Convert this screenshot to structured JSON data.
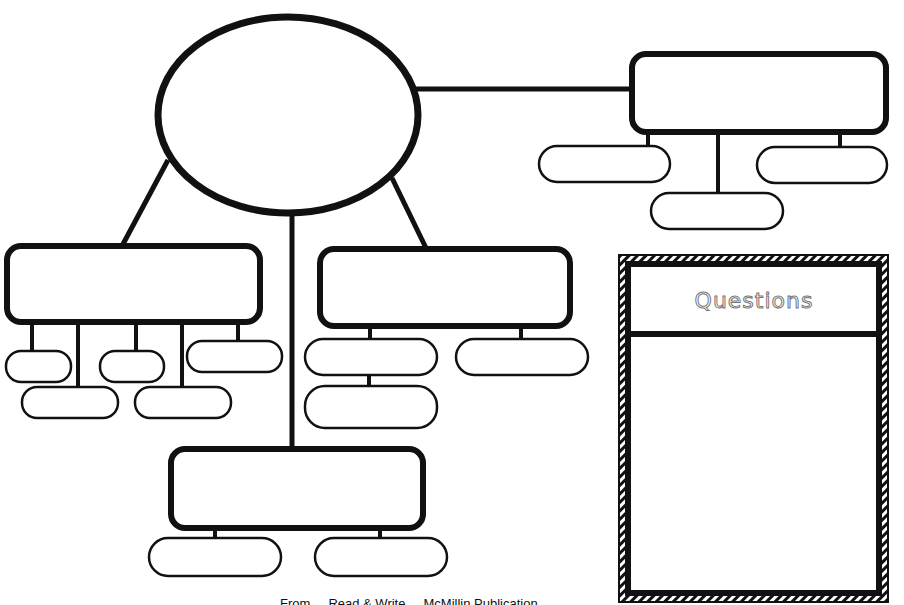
{
  "diagram": {
    "type": "graphic-organizer",
    "stroke_color": "#111111",
    "background_color": "#ffffff",
    "central_node": {
      "shape": "ellipse",
      "text": ""
    },
    "branches": [
      {
        "id": "top-right",
        "text": "",
        "children": [
          "",
          "",
          ""
        ]
      },
      {
        "id": "left",
        "text": "",
        "children": [
          "",
          "",
          "",
          "",
          ""
        ]
      },
      {
        "id": "middle",
        "text": "",
        "children": [
          "",
          "",
          ""
        ]
      },
      {
        "id": "bottom",
        "text": "",
        "children": [
          "",
          ""
        ]
      }
    ]
  },
  "questions_panel": {
    "title": "Questions",
    "body": ""
  },
  "caption": "From ... Read & Write ... McMillin Publication"
}
